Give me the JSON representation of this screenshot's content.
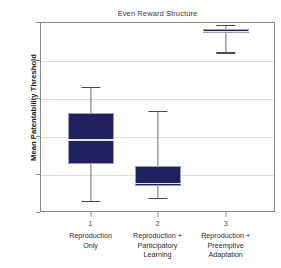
{
  "chart_data": {
    "type": "box",
    "title": "Even Reward Structure",
    "xlabel": "",
    "ylabel": "Mean Patentability Threshold",
    "ylim": [
      0,
      100
    ],
    "yticks": [
      0,
      20,
      40,
      60,
      80,
      100
    ],
    "grid": true,
    "legend": null,
    "categories": [
      {
        "num": "1",
        "line1": "Reproduction",
        "line2": "Only",
        "line3": ""
      },
      {
        "num": "2",
        "line1": "Reproduction +",
        "line2": "Participatory",
        "line3": "Learning"
      },
      {
        "num": "3",
        "line1": "Reproduction +",
        "line2": "Preemptive",
        "line3": "Adaptation"
      }
    ],
    "boxes": [
      {
        "label": "Reproduction Only",
        "whisker_low": 6,
        "q1": 25,
        "median": 38,
        "q3": 52,
        "whisker_high": 66
      },
      {
        "label": "Reproduction + Participatory Learning",
        "whisker_low": 7.5,
        "q1": 13.5,
        "median": 15,
        "q3": 24,
        "whisker_high": 53
      },
      {
        "label": "Reproduction + Preemptive Adaptation",
        "whisker_low": 84,
        "q1": 94,
        "median": 95,
        "q3": 96.5,
        "whisker_high": 98.5
      }
    ],
    "colors": {
      "box_fill": "#1f2160",
      "box_edge": "#9b9bbd",
      "median": "#e8e8f2",
      "whisker": "#6d6d6d",
      "grid": "#dedede",
      "axis": "#8a8a8a",
      "background": "#ffffff"
    }
  }
}
